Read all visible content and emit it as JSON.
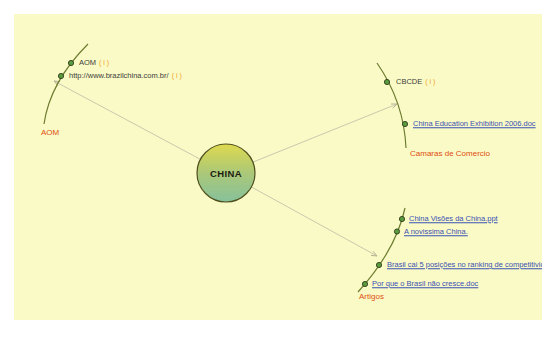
{
  "colors": {
    "page-bg": "#ffffff",
    "canvas-bg": "#fafac6",
    "branch": "#6e7c30",
    "connector": "#c9c9ad",
    "arrow": "#b4b292",
    "bead-fill": "#5a9a40",
    "bead-stroke": "#2f3d18",
    "link": "#3a50b4",
    "plain-text": "#40403a",
    "branch-label": "#e04e10",
    "suffix": "#f0a228",
    "node-top": "#ded94f",
    "node-mid": "#abc878",
    "node-bottom": "#86c19c",
    "node-stroke": "#4f501e",
    "center-text": "#1b1b10"
  },
  "map": {
    "center": {
      "label": "CHINA"
    },
    "branches": [
      {
        "label": "AOM",
        "nodes": [
          {
            "label": "AOM",
            "suffix": "( i )"
          },
          {
            "label": "http://www.brazilchina.com.br/",
            "suffix": "( i )"
          }
        ]
      },
      {
        "label": "Camaras de Comercio",
        "nodes": [
          {
            "label": "CBCDE",
            "suffix": "( i )"
          },
          {
            "label": "China Education Exhibition 2006.doc"
          }
        ]
      },
      {
        "label": "Artigos",
        "nodes": [
          {
            "label": "China Visões da China.ppt"
          },
          {
            "label": "A novissima China."
          },
          {
            "label": "Brasil cai 5 posições no ranking de competitivid"
          },
          {
            "label": "Por que o Brasil não cresce.doc"
          }
        ]
      }
    ]
  }
}
